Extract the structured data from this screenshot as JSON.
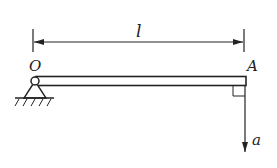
{
  "diagram": {
    "type": "physics-beam",
    "labels": {
      "length": "l",
      "pivot": "O",
      "end": "A",
      "acceleration": "a"
    },
    "colors": {
      "ink": "#222222",
      "background": "#ffffff"
    }
  }
}
